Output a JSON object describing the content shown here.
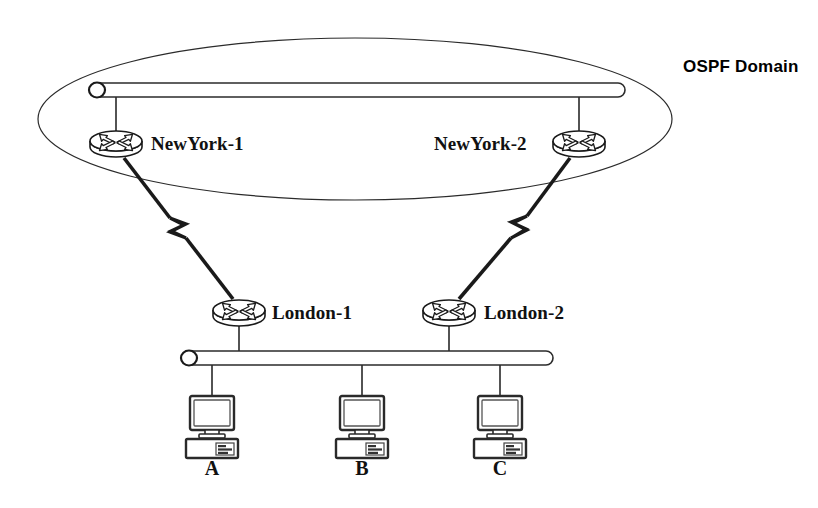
{
  "diagram": {
    "type": "network-topology",
    "title_label": "OSPF Domain",
    "background_color": "#ffffff",
    "line_color": "#1a1a1a",
    "domain": {
      "name": "OSPF Domain",
      "shape": "ellipse",
      "label": "OSPF Domain",
      "label_x": 683,
      "label_y": 58,
      "cx": 355,
      "cy": 119,
      "rx": 317,
      "ry": 81
    },
    "segments": [
      {
        "name": "ospf-backbone-ethernet",
        "kind": "ethernet-bar",
        "x1": 92,
        "x2": 626,
        "y": 90,
        "label": ""
      },
      {
        "name": "london-lan-ethernet",
        "kind": "ethernet-bar",
        "x1": 184,
        "x2": 553,
        "y": 358,
        "label": ""
      }
    ],
    "routers": [
      {
        "id": "newyork-1",
        "label": "NewYork-1",
        "x": 116,
        "y": 141,
        "label_side": "right",
        "label_x": 151,
        "label_y": 134
      },
      {
        "id": "newyork-2",
        "label": "NewYork-2",
        "x": 579,
        "y": 141,
        "label_side": "left",
        "label_x": 434,
        "label_y": 134
      },
      {
        "id": "london-1",
        "label": "London-1",
        "x": 239,
        "y": 310,
        "label_side": "right",
        "label_x": 272,
        "label_y": 303
      },
      {
        "id": "london-2",
        "label": "London-2",
        "x": 449,
        "y": 310,
        "label_side": "right",
        "label_x": 484,
        "label_y": 303
      }
    ],
    "hosts": [
      {
        "id": "host-a",
        "label": "A",
        "x": 212,
        "y": 420,
        "label_y": 458
      },
      {
        "id": "host-b",
        "label": "B",
        "x": 362,
        "y": 420,
        "label_y": 458
      },
      {
        "id": "host-c",
        "label": "C",
        "x": 500,
        "y": 420,
        "label_y": 458
      }
    ],
    "links": [
      {
        "id": "link-ny1-backbone",
        "kind": "ethernet-drop",
        "from": "ospf-backbone-ethernet",
        "to": "newyork-1",
        "x1": 116,
        "y1": 94,
        "x2": 116,
        "y2": 130
      },
      {
        "id": "link-ny2-backbone",
        "kind": "ethernet-drop",
        "from": "ospf-backbone-ethernet",
        "to": "newyork-2",
        "x1": 579,
        "y1": 94,
        "x2": 579,
        "y2": 130
      },
      {
        "id": "link-ny1-london1",
        "kind": "serial-wan",
        "from": "newyork-1",
        "to": "london-1",
        "x1": 124,
        "y1": 158,
        "x2": 232,
        "y2": 298
      },
      {
        "id": "link-ny2-london2",
        "kind": "serial-wan",
        "from": "newyork-2",
        "to": "london-2",
        "x1": 570,
        "y1": 158,
        "x2": 458,
        "y2": 298
      },
      {
        "id": "link-london1-lan",
        "kind": "ethernet-drop",
        "from": "london-1",
        "to": "london-lan-ethernet",
        "x1": 239,
        "y1": 322,
        "x2": 239,
        "y2": 353
      },
      {
        "id": "link-london2-lan",
        "kind": "ethernet-drop",
        "from": "london-2",
        "to": "london-lan-ethernet",
        "x1": 449,
        "y1": 322,
        "x2": 449,
        "y2": 353
      },
      {
        "id": "link-hosta-lan",
        "kind": "ethernet-drop",
        "from": "london-lan-ethernet",
        "to": "host-a",
        "x1": 212,
        "y1": 363,
        "x2": 212,
        "y2": 396
      },
      {
        "id": "link-hostb-lan",
        "kind": "ethernet-drop",
        "from": "london-lan-ethernet",
        "to": "host-b",
        "x1": 362,
        "y1": 363,
        "x2": 362,
        "y2": 396
      },
      {
        "id": "link-hostc-lan",
        "kind": "ethernet-drop",
        "from": "london-lan-ethernet",
        "to": "host-c",
        "x1": 500,
        "y1": 363,
        "x2": 500,
        "y2": 396
      }
    ]
  }
}
